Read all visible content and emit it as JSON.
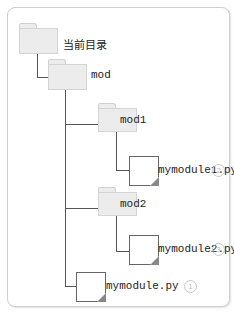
{
  "tree": {
    "root": {
      "label": "当前目录",
      "type": "folder"
    },
    "mod": {
      "label": "mod",
      "type": "folder"
    },
    "mod1": {
      "label": "mod1",
      "type": "folder"
    },
    "mymodule1": {
      "label": "mymodule1.py",
      "type": "file",
      "badge": "2"
    },
    "mod2": {
      "label": "mod2",
      "type": "folder"
    },
    "mymodule2": {
      "label": "mymodule2.py",
      "type": "file",
      "badge": "3"
    },
    "mymodule": {
      "label": "mymodule.py",
      "type": "file",
      "badge": "1"
    }
  },
  "colors": {
    "folder_fill": "#ececec",
    "line": "#555555",
    "badge": "#bdbdbd"
  }
}
